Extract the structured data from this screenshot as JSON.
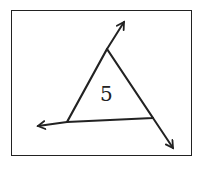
{
  "diagram": {
    "center_label": "5",
    "stroke_color": "#222222",
    "background": "#ffffff",
    "vertices": {
      "top": [
        107,
        49
      ],
      "bottom_left": [
        67,
        122
      ],
      "bottom_right": [
        153,
        118
      ]
    },
    "arrows": [
      {
        "name": "arrow-up-right",
        "from": [
          107,
          49
        ],
        "to": [
          124,
          22
        ]
      },
      {
        "name": "arrow-left",
        "from": [
          67,
          122
        ],
        "to": [
          38,
          126
        ]
      },
      {
        "name": "arrow-down-right",
        "from": [
          153,
          118
        ],
        "to": [
          173,
          148
        ]
      }
    ]
  }
}
